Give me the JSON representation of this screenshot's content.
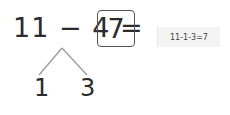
{
  "equation": {
    "expression": "11 − 4 =",
    "answer": "7"
  },
  "decomposition": {
    "left": "1",
    "right": "3",
    "line_color": "#9a9a9a"
  },
  "hint": {
    "text": "11-1-3=7"
  }
}
